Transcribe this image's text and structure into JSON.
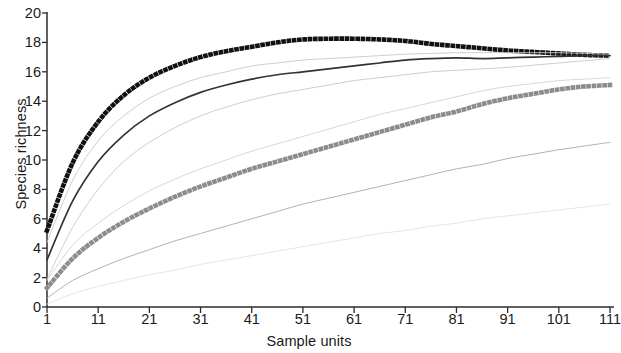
{
  "chart_data": {
    "type": "line",
    "title": "",
    "xlabel": "Sample units",
    "ylabel": "Species richness",
    "xlim": [
      1,
      111
    ],
    "ylim": [
      0,
      20
    ],
    "grid": false,
    "legend": "none",
    "xticks": [
      1,
      11,
      21,
      31,
      41,
      51,
      61,
      71,
      81,
      91,
      101,
      111
    ],
    "yticks": [
      0,
      2,
      4,
      6,
      8,
      10,
      12,
      14,
      16,
      18,
      20
    ],
    "x": [
      1,
      6,
      11,
      16,
      21,
      26,
      31,
      36,
      41,
      46,
      51,
      56,
      61,
      66,
      71,
      76,
      81,
      86,
      91,
      96,
      101,
      106,
      111
    ],
    "series": [
      {
        "name": "black-dotted-upper",
        "style": "dotted-thick",
        "color": "#111111",
        "values": [
          5.2,
          9.8,
          12.6,
          14.4,
          15.6,
          16.4,
          17.0,
          17.4,
          17.7,
          18.0,
          18.2,
          18.25,
          18.25,
          18.2,
          18.1,
          17.9,
          17.75,
          17.6,
          17.45,
          17.35,
          17.25,
          17.15,
          17.1
        ]
      },
      {
        "name": "solid-black-mean",
        "style": "solid-medium",
        "color": "#333333",
        "values": [
          3.2,
          7.2,
          9.9,
          11.7,
          13.0,
          13.9,
          14.6,
          15.1,
          15.5,
          15.8,
          16.0,
          16.2,
          16.4,
          16.6,
          16.8,
          16.9,
          16.95,
          16.9,
          16.95,
          17.0,
          17.05,
          17.1,
          17.1
        ]
      },
      {
        "name": "gray-thin-upper-ci",
        "style": "solid-thin",
        "color": "#c8c8c8",
        "values": [
          4.4,
          8.6,
          11.3,
          13.0,
          14.2,
          15.0,
          15.6,
          16.0,
          16.4,
          16.6,
          16.8,
          16.9,
          17.0,
          17.1,
          17.2,
          17.25,
          17.3,
          17.3,
          17.3,
          17.3,
          17.3,
          17.25,
          17.2
        ]
      },
      {
        "name": "gray-thin-lower-ci",
        "style": "solid-thin",
        "color": "#c8c8c8",
        "values": [
          1.9,
          5.4,
          8.0,
          9.9,
          11.2,
          12.2,
          13.0,
          13.6,
          14.1,
          14.5,
          14.8,
          15.1,
          15.4,
          15.6,
          15.8,
          16.0,
          16.1,
          16.2,
          16.3,
          16.45,
          16.6,
          16.75,
          16.9
        ]
      },
      {
        "name": "gray-dotted-second",
        "style": "dotted-thick",
        "color": "#8c8c8c",
        "values": [
          1.3,
          3.3,
          4.7,
          5.8,
          6.7,
          7.5,
          8.2,
          8.8,
          9.4,
          9.9,
          10.4,
          10.9,
          11.4,
          11.9,
          12.4,
          12.9,
          13.3,
          13.8,
          14.2,
          14.5,
          14.8,
          15.0,
          15.1
        ]
      },
      {
        "name": "gray-thin-second-upper",
        "style": "solid-thin",
        "color": "#d2d2d2",
        "values": [
          1.8,
          4.2,
          5.7,
          6.9,
          7.9,
          8.7,
          9.4,
          10.0,
          10.6,
          11.1,
          11.6,
          12.1,
          12.6,
          13.1,
          13.5,
          13.9,
          14.3,
          14.7,
          15.0,
          15.2,
          15.4,
          15.5,
          15.6
        ]
      },
      {
        "name": "gray-thin-third",
        "style": "solid-thin",
        "color": "#a9a9a9",
        "values": [
          0.6,
          1.8,
          2.6,
          3.3,
          3.9,
          4.5,
          5.0,
          5.5,
          6.0,
          6.5,
          7.0,
          7.4,
          7.8,
          8.2,
          8.6,
          9.0,
          9.4,
          9.7,
          10.1,
          10.4,
          10.7,
          10.95,
          11.2
        ]
      },
      {
        "name": "gray-thin-fourth-faint",
        "style": "solid-thin",
        "color": "#e2e2e2",
        "values": [
          0.2,
          0.9,
          1.4,
          1.8,
          2.2,
          2.5,
          2.9,
          3.2,
          3.5,
          3.8,
          4.1,
          4.4,
          4.7,
          5.0,
          5.2,
          5.5,
          5.7,
          6.0,
          6.2,
          6.4,
          6.6,
          6.8,
          7.0
        ]
      }
    ]
  },
  "axes": {
    "x_title": "Sample units",
    "y_title": "Species richness",
    "x_labels": [
      "1",
      "11",
      "21",
      "31",
      "41",
      "51",
      "61",
      "71",
      "81",
      "91",
      "101",
      "111"
    ],
    "y_labels": [
      "0",
      "2",
      "4",
      "6",
      "8",
      "10",
      "12",
      "14",
      "16",
      "18",
      "20"
    ],
    "axis_color": "#2b2b2b"
  }
}
